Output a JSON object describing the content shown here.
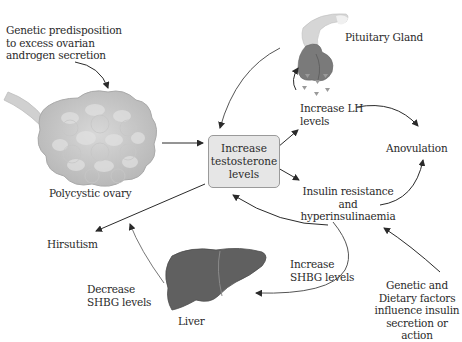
{
  "diagram": {
    "center_box": "Increase\ntestosterone\nlevels",
    "nodes": {
      "genetic_predisposition": "Genetic predisposition\nto excess ovarian\nandrogen secretion",
      "polycystic_ovary": "Polycystic ovary",
      "pituitary_gland": "Pituitary Gland",
      "increase_lh": "Increase LH\nlevels",
      "anovulation": "Anovulation",
      "insulin_resistance": "Insulin resistance\nand\nhyperinsulinaemia",
      "hirsutism": "Hirsutism",
      "increase_shbg": "Increase\nSHBG levels",
      "decrease_shbg": "Decrease\nSHBG levels",
      "liver": "Liver",
      "genetic_dietary": "Genetic and\nDietary factors\ninfluence insulin\nsecretion or action"
    },
    "icons": [
      "ovary-icon",
      "pituitary-gland-icon",
      "hormone-particles-icon",
      "liver-icon"
    ],
    "colors": {
      "ovary": "#c4c4c4",
      "pituitary": "#7a7a7a",
      "liver": "#5f5f5f",
      "box_fill": "#e6e6e6",
      "arrow": "#2a2a2a"
    }
  }
}
